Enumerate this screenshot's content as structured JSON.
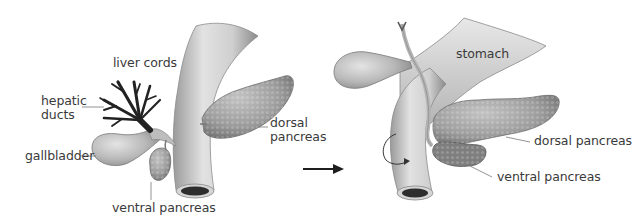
{
  "figure": {
    "left_panel": {
      "labels": {
        "liver_cords": "liver cords",
        "hepatic_ducts_line1": "hepatic",
        "hepatic_ducts_line2": "ducts",
        "gallbladder": "gallbladder",
        "dorsal_pancreas_line1": "dorsal",
        "dorsal_pancreas_line2": "pancreas",
        "ventral_pancreas": "ventral pancreas"
      }
    },
    "transition_arrow": "right-arrow-icon",
    "right_panel": {
      "labels": {
        "stomach": "stomach",
        "dorsal_pancreas": "dorsal pancreas",
        "ventral_pancreas": "ventral pancreas"
      },
      "rotation_indicator": "curved-rotation-arrow-icon"
    },
    "colors": {
      "background": "#ffffff",
      "organ_fill": "#c9c9c9",
      "organ_shade": "#8e8e8e",
      "duct_dark": "#2a2a2a",
      "pancreas_fill": "#9a9a9a",
      "label_text": "#3a3a3a",
      "leader_line": "#666666"
    }
  }
}
